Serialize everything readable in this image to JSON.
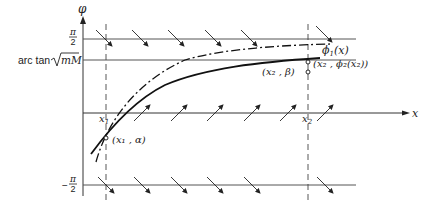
{
  "diagram": {
    "axes": {
      "y_label": "φ",
      "x_label": "x"
    },
    "horizontal_lines": {
      "upper": {
        "label_num": "π",
        "label_den": "2",
        "label": "π/2"
      },
      "middle": {
        "label_prefix": "arc tan",
        "label_radicand": "mM",
        "label": "arc tan √mM"
      },
      "lower": {
        "label_sign": "−",
        "label_num": "π",
        "label_den": "2",
        "label": "−π/2"
      }
    },
    "vertical_markers": {
      "x1": {
        "label": "x",
        "sub": "1"
      },
      "x2": {
        "label": "x",
        "sub": "2"
      }
    },
    "curves": {
      "phi1": {
        "label": "ϕ",
        "sub": "1",
        "arg": "(x)",
        "style": "dash-dot"
      },
      "phi2": {
        "style": "solid"
      }
    },
    "points": {
      "start": {
        "label": "(x₁ , α)"
      },
      "end_beta": {
        "label": "(x₂ , β)"
      },
      "end_phi2": {
        "label": "(x₂ , ϕ₂(x₂))"
      }
    },
    "direction_field": {
      "rows": [
        {
          "name": "upper",
          "direction": "down-right",
          "count": 6
        },
        {
          "name": "x-axis",
          "direction": "up-right",
          "count": 5
        },
        {
          "name": "lower",
          "direction": "down-right",
          "count": 4
        }
      ]
    }
  }
}
